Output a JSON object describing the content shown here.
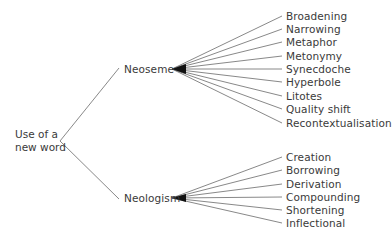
{
  "root": {
    "line1": "Use of a",
    "line2": "new word"
  },
  "branches": [
    {
      "label": "Neoseme",
      "children": [
        "Broadening",
        "Narrowing",
        "Metaphor",
        "Metonymy",
        "Synecdoche",
        "Hyperbole",
        "Litotes",
        "Quality shift",
        "Recontextualisation"
      ]
    },
    {
      "label": "Neologism",
      "children": [
        "Creation",
        "Borrowing",
        "Derivation",
        "Compounding",
        "Shortening",
        "Inflectional"
      ]
    }
  ],
  "colors": {
    "line": "#666666",
    "text": "#3a3a3a"
  }
}
